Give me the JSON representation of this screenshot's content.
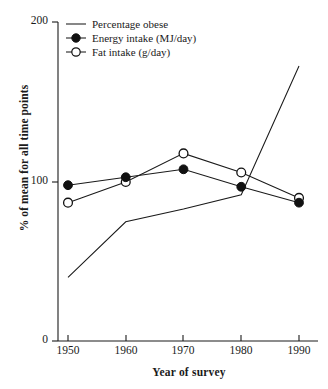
{
  "chart_data": {
    "type": "line",
    "title": "",
    "xlabel": "Year of survey",
    "ylabel": "% of mean for all time points",
    "x": [
      1950,
      1960,
      1970,
      1980,
      1990
    ],
    "xtick_labels": [
      "1950",
      "1960",
      "1970",
      "1980",
      "1990"
    ],
    "ytick_labels": [
      "0",
      "100",
      "200"
    ],
    "yticks": [
      0,
      100,
      200
    ],
    "xlim": [
      1947,
      1994
    ],
    "ylim": [
      0,
      200
    ],
    "grid": false,
    "legend_position": "top-left",
    "series": [
      {
        "name": "Percentage obese",
        "marker": "none",
        "values": [
          40,
          75,
          83,
          92,
          173
        ]
      },
      {
        "name": "Energy intake (MJ/day)",
        "marker": "filled-circle",
        "values": [
          98,
          103,
          108,
          97,
          87
        ]
      },
      {
        "name": "Fat intake (g/day)",
        "marker": "open-circle",
        "values": [
          87,
          100,
          118,
          106,
          90
        ]
      }
    ]
  },
  "legend": {
    "items": [
      {
        "label": "Percentage obese",
        "marker": "line"
      },
      {
        "label": "Energy intake (MJ/day)",
        "marker": "filled-circle"
      },
      {
        "label": "Fat intake (g/day)",
        "marker": "open-circle"
      }
    ]
  },
  "axes": {
    "y_title": "% of mean for all time points",
    "x_title": "Year of survey",
    "y_tick_200": "200",
    "y_tick_100": "100",
    "y_tick_0": "0",
    "x_tick_1950": "1950",
    "x_tick_1960": "1960",
    "x_tick_1970": "1970",
    "x_tick_1980": "1980",
    "x_tick_1990": "1990"
  },
  "style": {
    "line_color": "#1a1a1a",
    "marker_fill": "#111111",
    "marker_open_fill": "#ffffff",
    "background": "#ffffff"
  }
}
